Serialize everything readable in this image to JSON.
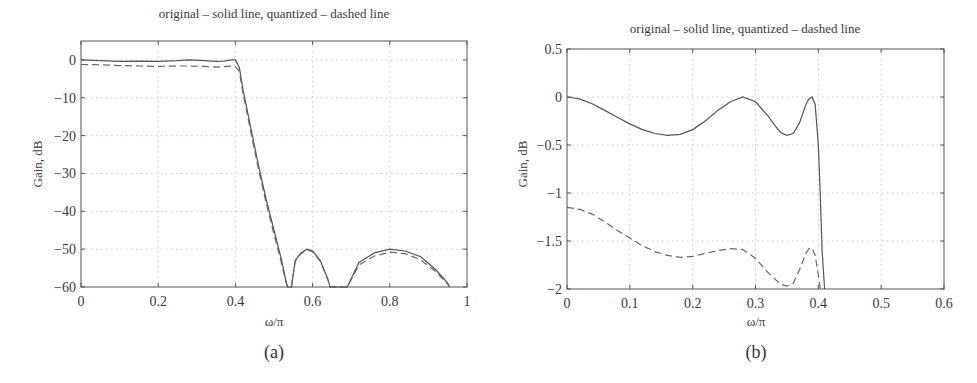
{
  "chart_data": [
    {
      "id": "a",
      "type": "line",
      "title": "original – solid line, quantized – dashed line",
      "xlabel": "ω/π",
      "ylabel": "Gain, dB",
      "caption": "(a)",
      "xlim": [
        0,
        1
      ],
      "ylim": [
        -60,
        5
      ],
      "xticks": [
        0,
        0.2,
        0.4,
        0.6,
        0.8,
        1
      ],
      "xtick_labels": [
        "0",
        "0.2",
        "0.4",
        "0.6",
        "0.8",
        "1"
      ],
      "yticks": [
        0,
        -10,
        -20,
        -30,
        -40,
        -50,
        -60
      ],
      "ytick_labels": [
        "0",
        "−10",
        "−20",
        "−30",
        "−40",
        "−50",
        "−60"
      ],
      "grid": true,
      "legend": "none (described in title)",
      "series": [
        {
          "name": "original",
          "style": "solid",
          "x": [
            0,
            0.05,
            0.1,
            0.15,
            0.2,
            0.25,
            0.28,
            0.32,
            0.35,
            0.37,
            0.39,
            0.4,
            0.41,
            0.42,
            0.44,
            0.46,
            0.48,
            0.5,
            0.52,
            0.53,
            0.535,
            0.545,
            0.555,
            0.57,
            0.585,
            0.6,
            0.62,
            0.64,
            0.645,
            0.69,
            0.72,
            0.76,
            0.8,
            0.84,
            0.88,
            0.92,
            0.95,
            0.955
          ],
          "y": [
            0,
            -0.2,
            -0.4,
            -0.3,
            -0.4,
            -0.2,
            0,
            -0.2,
            -0.4,
            -0.3,
            0,
            0,
            -2,
            -8,
            -18,
            -28,
            -37,
            -45,
            -53,
            -58,
            -60,
            -60,
            -53,
            -51,
            -50,
            -50.5,
            -53,
            -58,
            -60,
            -60,
            -53.5,
            -51,
            -50,
            -50.5,
            -52,
            -55.5,
            -59,
            -60
          ]
        },
        {
          "name": "quantized",
          "style": "dashed",
          "x": [
            0,
            0.05,
            0.1,
            0.15,
            0.2,
            0.25,
            0.28,
            0.32,
            0.35,
            0.37,
            0.39,
            0.4,
            0.41,
            0.42,
            0.44,
            0.46,
            0.48,
            0.5,
            0.52,
            0.53,
            0.535,
            0.545,
            0.555,
            0.57,
            0.585,
            0.6,
            0.62,
            0.64,
            0.645,
            0.69,
            0.72,
            0.76,
            0.8,
            0.84,
            0.88,
            0.92,
            0.95,
            0.955
          ],
          "y": [
            -1.2,
            -1.3,
            -1.5,
            -1.6,
            -1.7,
            -1.6,
            -1.6,
            -1.7,
            -1.9,
            -1.8,
            -1.6,
            -1.8,
            -3,
            -9,
            -19,
            -29,
            -38,
            -46,
            -54,
            -58.5,
            -60,
            -60,
            -53.2,
            -51.2,
            -50.2,
            -50.7,
            -53.2,
            -58.2,
            -60,
            -60,
            -54.2,
            -51.8,
            -50.8,
            -51.2,
            -52.8,
            -56,
            -59.3,
            -60
          ]
        }
      ]
    },
    {
      "id": "b",
      "type": "line",
      "title": "original – solid line, quantized – dashed line",
      "xlabel": "ω/π",
      "ylabel": "Gain, dB",
      "caption": "(b)",
      "xlim": [
        0,
        0.6
      ],
      "ylim": [
        -2,
        0.5
      ],
      "xticks": [
        0,
        0.1,
        0.2,
        0.3,
        0.4,
        0.5,
        0.6
      ],
      "xtick_labels": [
        "0",
        "0.1",
        "0.2",
        "0.3",
        "0.4",
        "0.5",
        "0.6"
      ],
      "yticks": [
        0.5,
        0,
        -0.5,
        -1,
        -1.5,
        -2
      ],
      "ytick_labels": [
        "0.5",
        "0",
        "−0.5",
        "−1",
        "−1.5",
        "−2"
      ],
      "grid": true,
      "legend": "none (described in title)",
      "series": [
        {
          "name": "original",
          "style": "solid",
          "x": [
            0,
            0.02,
            0.04,
            0.06,
            0.08,
            0.1,
            0.12,
            0.14,
            0.16,
            0.18,
            0.2,
            0.22,
            0.24,
            0.26,
            0.28,
            0.3,
            0.32,
            0.33,
            0.34,
            0.35,
            0.36,
            0.37,
            0.38,
            0.385,
            0.39,
            0.395,
            0.4,
            0.403,
            0.406,
            0.41
          ],
          "y": [
            0,
            -0.02,
            -0.07,
            -0.14,
            -0.21,
            -0.28,
            -0.34,
            -0.38,
            -0.4,
            -0.39,
            -0.34,
            -0.25,
            -0.14,
            -0.05,
            0,
            -0.05,
            -0.2,
            -0.29,
            -0.37,
            -0.4,
            -0.38,
            -0.27,
            -0.08,
            -0.02,
            0,
            -0.08,
            -0.5,
            -1.0,
            -1.6,
            -2.0
          ]
        },
        {
          "name": "quantized",
          "style": "dashed",
          "x": [
            0,
            0.02,
            0.04,
            0.06,
            0.08,
            0.1,
            0.12,
            0.14,
            0.16,
            0.18,
            0.2,
            0.22,
            0.24,
            0.26,
            0.28,
            0.3,
            0.32,
            0.34,
            0.35,
            0.36,
            0.37,
            0.38,
            0.385,
            0.39,
            0.395,
            0.4,
            0.403
          ],
          "y": [
            -1.15,
            -1.17,
            -1.22,
            -1.3,
            -1.39,
            -1.47,
            -1.55,
            -1.61,
            -1.65,
            -1.67,
            -1.66,
            -1.63,
            -1.6,
            -1.58,
            -1.59,
            -1.68,
            -1.83,
            -1.95,
            -1.97,
            -1.94,
            -1.8,
            -1.63,
            -1.58,
            -1.57,
            -1.65,
            -1.85,
            -2.0
          ]
        }
      ]
    }
  ]
}
